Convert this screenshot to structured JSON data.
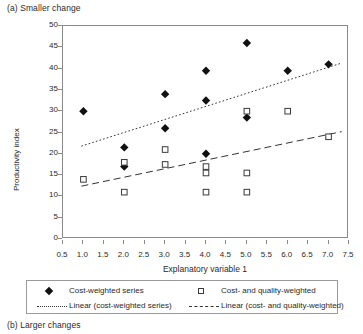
{
  "figure": {
    "caption_a": "(a) Smaller change",
    "caption_b": "(b) Larger changes"
  },
  "legend": {
    "items": [
      {
        "label": "Cost-weighted series",
        "symbol": "filled-diamond"
      },
      {
        "label": "Cost- and quality-weighted",
        "symbol": "open-square"
      },
      {
        "label": "Linear (cost-weighted series)",
        "symbol": "dotted-line"
      },
      {
        "label": "Linear (cost- and quality-weighted)",
        "symbol": "dashed-line"
      }
    ]
  },
  "chart_data": {
    "type": "scatter",
    "title": "(a) Smaller change",
    "xlabel": "Explanatory variable 1",
    "ylabel": "Productivity index",
    "xlim": [
      0.5,
      7.5
    ],
    "ylim": [
      0,
      50
    ],
    "xticks": [
      0.5,
      1.0,
      1.5,
      2.0,
      2.5,
      3.0,
      3.5,
      4.0,
      4.5,
      5.0,
      5.5,
      6.0,
      6.5,
      7.0,
      7.5
    ],
    "yticks": [
      0,
      5,
      10,
      15,
      20,
      25,
      30,
      35,
      40,
      45,
      50
    ],
    "xtick_labels": [
      "0.5",
      "1.0",
      "1.5",
      "2.0",
      "2.5",
      "3.0",
      "3.5",
      "4.0",
      "4.5",
      "5.0",
      "5.5",
      "6.0",
      "6.5",
      "7.0",
      "7.5"
    ],
    "ytick_labels": [
      "0",
      "5",
      "10",
      "15",
      "20",
      "25",
      "30",
      "35",
      "40",
      "45",
      "50"
    ],
    "grid": false,
    "legend_position": "below",
    "series": [
      {
        "name": "Cost-weighted series",
        "marker": "filled-diamond",
        "points": [
          {
            "x": 1.0,
            "y": 30.0
          },
          {
            "x": 2.0,
            "y": 21.5
          },
          {
            "x": 2.0,
            "y": 17.0
          },
          {
            "x": 3.0,
            "y": 34.0
          },
          {
            "x": 3.0,
            "y": 26.0
          },
          {
            "x": 4.0,
            "y": 39.5
          },
          {
            "x": 4.0,
            "y": 32.5
          },
          {
            "x": 4.0,
            "y": 20.0
          },
          {
            "x": 5.0,
            "y": 46.0
          },
          {
            "x": 5.0,
            "y": 28.5
          },
          {
            "x": 6.0,
            "y": 39.5
          },
          {
            "x": 7.0,
            "y": 41.0
          }
        ]
      },
      {
        "name": "Cost- and quality-weighted",
        "marker": "open-square",
        "points": [
          {
            "x": 1.0,
            "y": 14.0
          },
          {
            "x": 2.0,
            "y": 18.0
          },
          {
            "x": 2.0,
            "y": 11.0
          },
          {
            "x": 3.0,
            "y": 21.0
          },
          {
            "x": 3.0,
            "y": 17.5
          },
          {
            "x": 4.0,
            "y": 17.0
          },
          {
            "x": 4.0,
            "y": 15.5
          },
          {
            "x": 4.0,
            "y": 11.0
          },
          {
            "x": 5.0,
            "y": 30.0
          },
          {
            "x": 5.0,
            "y": 15.5
          },
          {
            "x": 5.0,
            "y": 11.0
          },
          {
            "x": 6.0,
            "y": 30.0
          },
          {
            "x": 7.0,
            "y": 24.0
          }
        ]
      }
    ],
    "trendlines": [
      {
        "name": "Linear (cost-weighted series)",
        "style": "dotted",
        "x0": 0.95,
        "y0": 21.8,
        "x1": 7.32,
        "y1": 41.3
      },
      {
        "name": "Linear (cost- and quality-weighted)",
        "style": "dashed",
        "x0": 0.95,
        "y0": 12.4,
        "x1": 7.32,
        "y1": 25.2
      }
    ]
  }
}
